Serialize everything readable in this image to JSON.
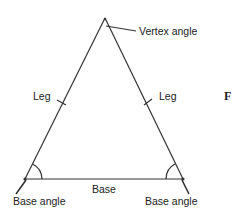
{
  "diagram": {
    "type": "isosceles-triangle",
    "labels": {
      "vertex_angle": "Vertex angle",
      "leg_left": "Leg",
      "leg_right": "Leg",
      "base": "Base",
      "base_angle_left": "Base angle",
      "base_angle_right": "Base angle",
      "figure_fragment": "F"
    },
    "colors": {
      "stroke": "#333333",
      "text": "#222222",
      "background": "#ffffff"
    }
  }
}
